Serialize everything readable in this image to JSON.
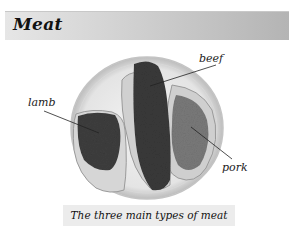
{
  "header": {
    "title": "Meat"
  },
  "figure": {
    "labels": {
      "beef": "beef",
      "lamb": "lamb",
      "pork": "pork"
    },
    "caption": "The three main types of meat"
  },
  "colors": {
    "header_gradient_start": "#e6e6e6",
    "header_gradient_end": "#b4b4b4",
    "caption_background": "#ececec"
  }
}
